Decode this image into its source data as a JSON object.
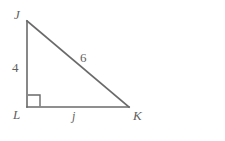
{
  "figure": {
    "kind": "right-triangle-diagram",
    "background_color": "#ffffff",
    "stroke_color": "#6a6a6a",
    "text_color": "#5f5f5f",
    "vertices": {
      "J": {
        "label": "J",
        "x": 27,
        "y": 21
      },
      "L": {
        "label": "L",
        "x": 27,
        "y": 107
      },
      "K": {
        "label": "K",
        "x": 129,
        "y": 107
      }
    },
    "right_angle": {
      "at_vertex": "L",
      "marker": "square",
      "size": 12
    },
    "sides": {
      "leg_vertical": {
        "name": "JL",
        "label": "4",
        "from": "J",
        "to": "L"
      },
      "leg_horizontal": {
        "name": "LK",
        "label": "j",
        "from": "L",
        "to": "K"
      },
      "hypotenuse": {
        "name": "JK",
        "label": "6",
        "from": "J",
        "to": "K"
      }
    }
  }
}
